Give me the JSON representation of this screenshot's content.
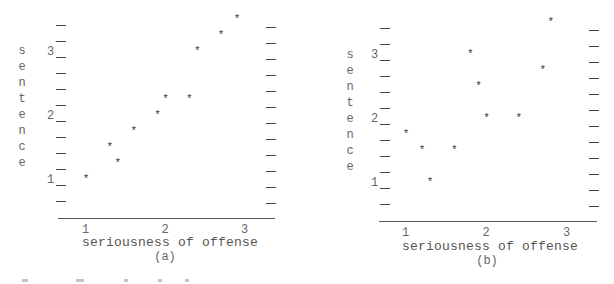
{
  "chart_data": [
    {
      "type": "scatter",
      "panel_label": "(a)",
      "title": "",
      "xlabel": "seriousness of offense",
      "ylabel": "sentence",
      "x_ticks": [
        "1",
        "2",
        "3"
      ],
      "y_ticks": [
        "1",
        "2",
        "3"
      ],
      "xlim": [
        0.8,
        3.2
      ],
      "ylim": [
        0.5,
        3.75
      ],
      "grid": false,
      "legend": null,
      "marker": "*",
      "points": [
        {
          "x": 1.0,
          "y": 1.11
        },
        {
          "x": 1.3,
          "y": 1.61
        },
        {
          "x": 1.4,
          "y": 1.36
        },
        {
          "x": 1.6,
          "y": 1.86
        },
        {
          "x": 1.9,
          "y": 2.11
        },
        {
          "x": 2.0,
          "y": 2.36
        },
        {
          "x": 2.3,
          "y": 2.36
        },
        {
          "x": 2.4,
          "y": 3.11
        },
        {
          "x": 2.7,
          "y": 3.36
        },
        {
          "x": 2.9,
          "y": 3.61
        }
      ]
    },
    {
      "type": "scatter",
      "panel_label": "(b)",
      "title": "",
      "xlabel": "seriousness of offense",
      "ylabel": "sentence",
      "x_ticks": [
        "1",
        "2",
        "3"
      ],
      "y_ticks": [
        "1",
        "2",
        "3"
      ],
      "xlim": [
        0.8,
        3.2
      ],
      "ylim": [
        0.5,
        3.75
      ],
      "grid": false,
      "legend": null,
      "marker": "*",
      "points": [
        {
          "x": 1.0,
          "y": 1.86
        },
        {
          "x": 1.2,
          "y": 1.61
        },
        {
          "x": 1.3,
          "y": 1.11
        },
        {
          "x": 1.6,
          "y": 1.61
        },
        {
          "x": 1.8,
          "y": 3.11
        },
        {
          "x": 1.9,
          "y": 2.61
        },
        {
          "x": 2.0,
          "y": 2.11
        },
        {
          "x": 2.4,
          "y": 2.11
        },
        {
          "x": 2.7,
          "y": 2.86
        },
        {
          "x": 2.8,
          "y": 3.61
        }
      ]
    }
  ],
  "panels": [
    {
      "label": "(a)",
      "xlabel": "seriousness of offense",
      "ylabel_letters": [
        "s",
        "e",
        "n",
        "t",
        "e",
        "n",
        "c",
        "e"
      ],
      "x_ticks": [
        "1",
        "2",
        "3"
      ],
      "y_ticks": [
        "1",
        "2",
        "3"
      ]
    },
    {
      "label": "(b)",
      "xlabel": "seriousness of offense",
      "ylabel_letters": [
        "s",
        "e",
        "n",
        "t",
        "e",
        "n",
        "c",
        "e"
      ],
      "x_ticks": [
        "1",
        "2",
        "3"
      ],
      "y_ticks": [
        "1",
        "2",
        "3"
      ]
    }
  ],
  "layout": [
    {
      "left_tick_x": 56,
      "right_tick_x": 266,
      "tick_top": 25,
      "tick_step": 16,
      "tick_count": 12,
      "right_tick_top": 27,
      "axis_y": 218,
      "axis_x0": 58,
      "axis_x1": 275,
      "y1_px": 185,
      "y_unit_px": 64,
      "x1_px": 86,
      "x_unit_px": 79.5,
      "ylabel_x": 17,
      "ylabel_y0": 45,
      "ylabel_step": 16,
      "xtitle_x": 170,
      "xtitle_y": 236,
      "sub_x": 165,
      "sub_y": 251
    },
    {
      "left_tick_x": 380,
      "right_tick_x": 589,
      "tick_top": 28,
      "tick_step": 16,
      "tick_count": 12,
      "right_tick_top": 30,
      "axis_y": 221,
      "axis_x0": 379,
      "axis_x1": 597,
      "y1_px": 188,
      "y_unit_px": 64,
      "x1_px": 406,
      "x_unit_px": 80.5,
      "ylabel_x": 345,
      "ylabel_y0": 49,
      "ylabel_step": 16,
      "xtitle_x": 490,
      "xtitle_y": 240,
      "sub_x": 487,
      "sub_y": 255
    }
  ]
}
